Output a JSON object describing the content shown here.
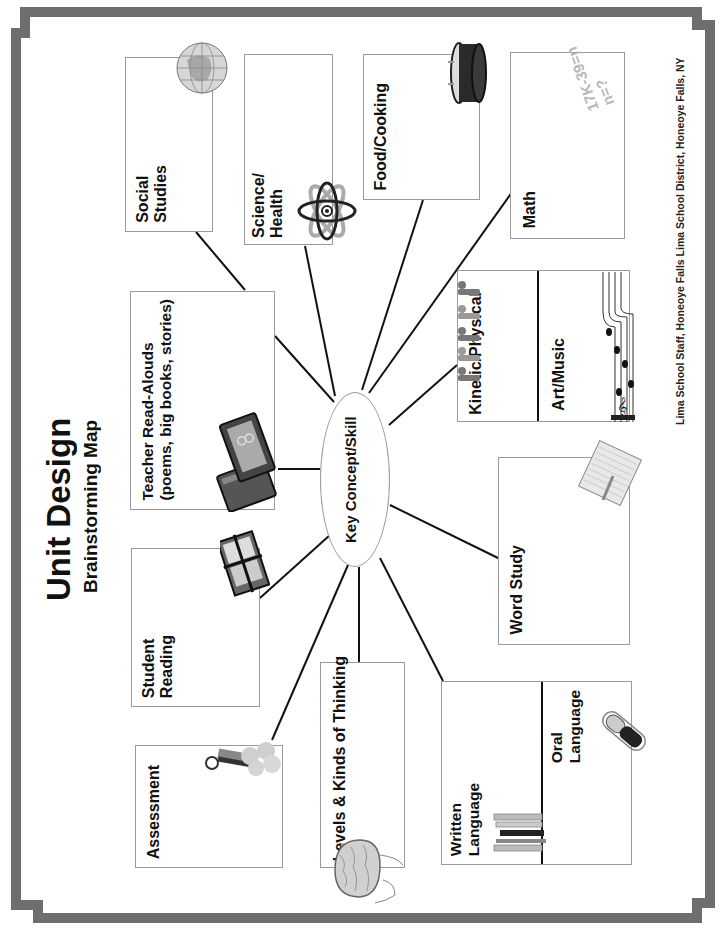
{
  "document": {
    "title": "Unit Design",
    "subtitle": "Brainstorming Map",
    "credit": "Lima School Staff, Honeoye Falls Lima School District, Honeoye Falls, NY",
    "center": {
      "label": "Key Concept/Skill"
    },
    "colors": {
      "frame": "#6e6e6e",
      "box_border": "#9a9a9a",
      "connector": "#111111",
      "text": "#111111",
      "math_text": "#b8b8b8"
    }
  },
  "boxes": {
    "social_studies": {
      "lines": [
        "Social",
        "Studies"
      ],
      "icon": "globe-icon"
    },
    "science_health": {
      "lines": [
        "Science/",
        "Health"
      ],
      "icon": "atom-icon"
    },
    "food_cooking": {
      "lines": [
        "Food/Cooking"
      ],
      "icon": "cooking-pot-icon"
    },
    "math": {
      "lines": [
        "Math"
      ],
      "icon": "math-equation-icon",
      "equation": [
        "17K-39=n",
        "n=?"
      ]
    },
    "teacher_read_alouds": {
      "lines": [
        "Teacher Read-Alouds",
        "(poems, big books, stories)"
      ],
      "icon": "open-book-icon"
    },
    "kinetic_physical": {
      "lines": [
        "Kinetic/Physical"
      ],
      "icon": "people-exercising-icon"
    },
    "art_music": {
      "lines": [
        "Art/Music"
      ],
      "icon": "music-staff-icon"
    },
    "word_study": {
      "lines": [
        "Word Study"
      ],
      "icon": "notepad-pencil-icon"
    },
    "student_reading": {
      "lines": [
        "Student",
        "Reading"
      ],
      "icon": "book-stack-icon"
    },
    "assessment": {
      "lines": [
        "Assessment"
      ],
      "icon": "ribbon-medals-icon"
    },
    "levels_kinds_thinking": {
      "lines": [
        "Levels & Kinds of Thinking"
      ],
      "icon": "brain-icon"
    },
    "written_language": {
      "lines": [
        "Written",
        "Language"
      ],
      "icon": "pencils-icon"
    },
    "oral_language": {
      "lines": [
        "Oral",
        "Language"
      ],
      "icon": "microphone-icon"
    }
  }
}
